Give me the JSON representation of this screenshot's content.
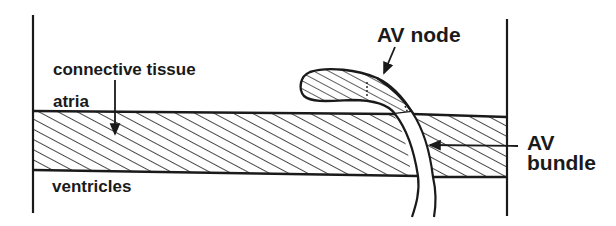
{
  "diagram": {
    "labels": {
      "connective_tissue": "connective tissue",
      "atria": "atria",
      "ventricles": "ventricles",
      "av_node": "AV node",
      "av_bundle_line1": "AV",
      "av_bundle_line2": "bundle"
    },
    "colors": {
      "ink": "#1a1a1a",
      "background": "#ffffff"
    },
    "regions": [
      {
        "name": "atria",
        "position": "above band"
      },
      {
        "name": "connective tissue",
        "position": "hatched band"
      },
      {
        "name": "ventricles",
        "position": "below band"
      },
      {
        "name": "AV node",
        "position": "hatched teardrop above band"
      },
      {
        "name": "AV bundle",
        "position": "unhatched channel crossing band"
      }
    ]
  }
}
